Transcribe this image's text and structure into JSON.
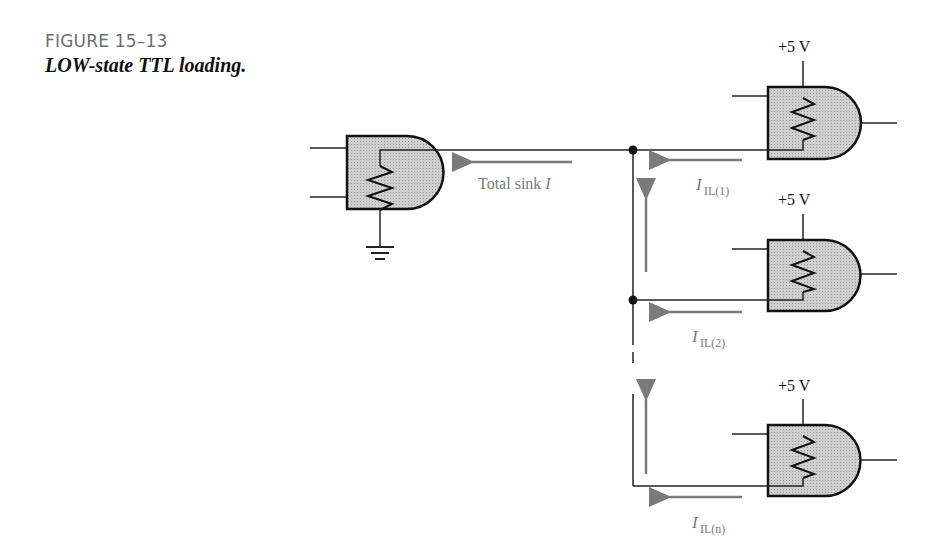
{
  "figure": {
    "number": "FIGURE 15–13",
    "caption": "LOW-state TTL loading."
  },
  "colors": {
    "wire": "#222222",
    "gate_fill": "#c8c8c8",
    "arrow": "#7a7a7a",
    "label_gray": "#7a7a7a",
    "title_gray": "#6d6e70"
  },
  "diagram": {
    "driver": {
      "name": "driving gate",
      "ground": "ground",
      "current_label": "Total sink I"
    },
    "loads": [
      {
        "supply": "+5 V",
        "current_main": "I",
        "current_sub": "IL(1)"
      },
      {
        "supply": "+5 V",
        "current_main": "I",
        "current_sub": "IL(2)"
      },
      {
        "supply": "+5 V",
        "current_main": "I",
        "current_sub": "IL(n)"
      }
    ],
    "total_label_main": "Total sink ",
    "total_label_italic": "I"
  }
}
